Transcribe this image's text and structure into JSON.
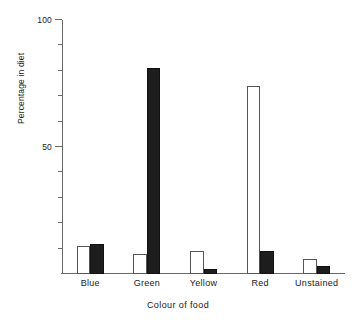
{
  "chart_data": {
    "type": "bar",
    "title": "",
    "xlabel": "Colour of food",
    "ylabel": "Percentage in diet",
    "categories": [
      "Blue",
      "Green",
      "Yellow",
      "Red",
      "Unstained"
    ],
    "series": [
      {
        "name": "white",
        "style": "open",
        "values": [
          11,
          8,
          9,
          74,
          6
        ]
      },
      {
        "name": "black",
        "style": "filled",
        "values": [
          12,
          81,
          2,
          9,
          3
        ]
      }
    ],
    "ylim": [
      0,
      100
    ],
    "y_major_ticks": [
      50,
      100
    ],
    "y_major_tick_labels": [
      "50",
      "100"
    ],
    "y_minor_ticks": [
      10,
      20,
      30,
      40,
      60,
      70,
      80,
      90
    ],
    "grid": false,
    "legend": "none",
    "axis_color": "#6a6a6a",
    "bar_fill_open": "#ffffff",
    "bar_fill_filled": "#1d1d1d",
    "bar_edge": "#555555"
  }
}
